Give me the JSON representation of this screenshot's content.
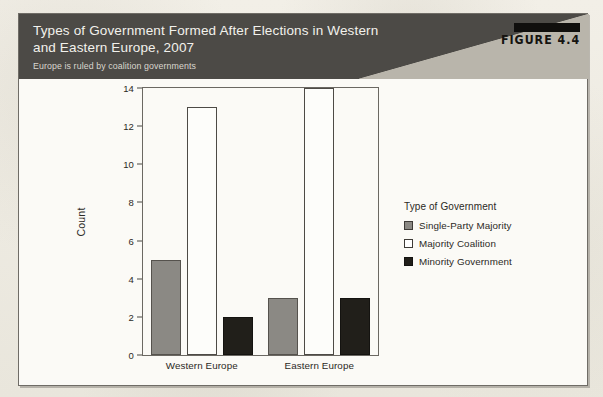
{
  "figure": {
    "number_label": "FIGURE 4.4",
    "title_lines": [
      "Types of Government Formed After Elections in Western",
      "and Eastern Europe, 2007"
    ],
    "subtitle": "Europe is ruled by coalition governments"
  },
  "colors": {
    "header_band": "#4c4a46",
    "header_diagonal": "#b9b5ab",
    "single_party_majority": "#8b8984",
    "majority_coalition": "#ffffff",
    "minority_government": "#201e19",
    "page_background": "#efece3",
    "figure_background": "#fbfaf6"
  },
  "chart_data": {
    "type": "bar",
    "title": "Types of Government Formed After Elections in Western and Eastern Europe, 2007",
    "subtitle": "Europe is ruled by coalition governments",
    "xlabel": "",
    "ylabel": "Count",
    "ylim": [
      0,
      14
    ],
    "yticks": [
      0,
      2,
      4,
      6,
      8,
      10,
      12,
      14
    ],
    "grid": false,
    "legend_position": "right",
    "legend_title": "Type of Government",
    "categories": [
      "Western Europe",
      "Eastern Europe"
    ],
    "series": [
      {
        "name": "Single-Party Majority",
        "values": [
          5,
          3
        ]
      },
      {
        "name": "Majority Coalition",
        "values": [
          13,
          14
        ]
      },
      {
        "name": "Minority Government",
        "values": [
          2,
          3
        ]
      }
    ]
  }
}
